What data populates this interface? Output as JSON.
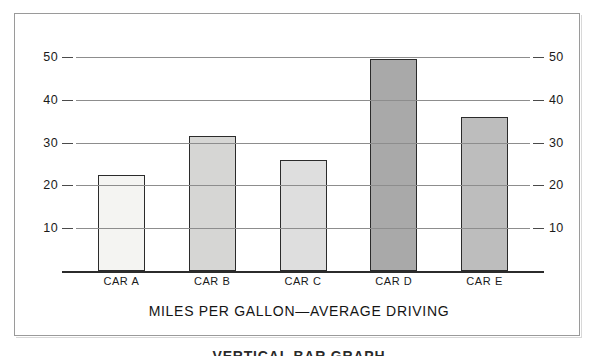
{
  "figure": {
    "caption": "MILES PER GALLON—AVERAGE DRIVING",
    "clipped_note": "VERTICAL BAR GRAPH"
  },
  "chart_data": {
    "type": "bar",
    "title": "MILES PER GALLON—AVERAGE DRIVING",
    "xlabel": "",
    "ylabel": "",
    "categories": [
      "CAR A",
      "CAR B",
      "CAR C",
      "CAR D",
      "CAR E"
    ],
    "values": [
      22.5,
      31.5,
      26,
      49.5,
      36
    ],
    "ylim": [
      0,
      50
    ],
    "y_ticks": [
      10,
      20,
      30,
      40,
      50
    ],
    "y_tick_labels": [
      "10",
      "20",
      "30",
      "40",
      "50"
    ],
    "grid": true,
    "grid_axis": "y",
    "legend": false,
    "dual_axis": true,
    "right_axis_ticks": [
      10,
      20,
      30,
      40,
      50
    ],
    "right_axis_tick_labels": [
      "10",
      "20",
      "30",
      "40",
      "50"
    ],
    "bar_colors": [
      "#f4f4f2",
      "#d6d6d4",
      "#dedede",
      "#a9a9a9",
      "#bdbdbd"
    ],
    "bar_border_color": "#2b2b2b",
    "background_color": "#ffffff",
    "gridline_color": "#8d8d8d",
    "axis_color": "#2b2b2b"
  }
}
